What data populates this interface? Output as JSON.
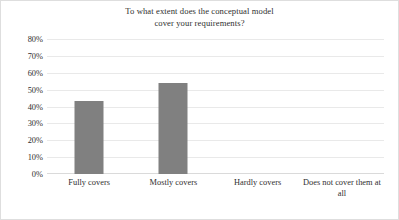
{
  "chart_data": {
    "type": "bar",
    "title": "To what extent does the conceptual model\ncover your requirements?",
    "title_line1": "To what extent does the conceptual model",
    "title_line2": "cover your requirements?",
    "xlabel": "",
    "ylabel": "",
    "categories": [
      "Fully covers",
      "Mostly covers",
      "Hardly covers",
      "Does not cover them at all"
    ],
    "values": [
      43,
      54,
      0,
      0
    ],
    "value_labels": [
      "43%",
      "54%",
      "0%",
      "0%"
    ],
    "ylim": [
      0,
      80
    ],
    "ytick_values": [
      80,
      70,
      60,
      50,
      40,
      30,
      20,
      10,
      0
    ],
    "ytick_labels": [
      "80%",
      "70%",
      "60%",
      "50%",
      "40%",
      "30%",
      "20%",
      "10%",
      "0%"
    ],
    "grid": true,
    "legend": false,
    "legend_position": "none",
    "bar_color": "#808080",
    "gridline_color": "#e9e9e9",
    "axis_color": "#dadada",
    "background_color": "#ffffff",
    "border_color": "#dedede",
    "text_color": "#2f2f2f"
  }
}
